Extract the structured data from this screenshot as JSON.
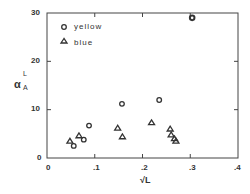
{
  "chart_data": {
    "type": "scatter",
    "title": "",
    "xlabel": "√L",
    "ylabel": "α_A^L",
    "xlim": [
      0,
      0.4
    ],
    "ylim": [
      0,
      30
    ],
    "xticks": [
      "0",
      ".1",
      ".2",
      ".3",
      ".4"
    ],
    "yticks": [
      "0",
      "10",
      "20",
      "30"
    ],
    "grid": false,
    "legend_position": "upper left inside",
    "series": [
      {
        "name": "yellow",
        "marker": "circle",
        "x": [
          0.056,
          0.077,
          0.088,
          0.157,
          0.235,
          0.304
        ],
        "y": [
          2.5,
          3.8,
          6.7,
          11.2,
          12.0,
          29.0
        ]
      },
      {
        "name": "blue",
        "marker": "triangle",
        "x": [
          0.048,
          0.067,
          0.148,
          0.158,
          0.219,
          0.258,
          0.26,
          0.267,
          0.27
        ],
        "y": [
          3.5,
          4.6,
          6.2,
          4.4,
          7.3,
          6.0,
          4.8,
          4.0,
          3.5
        ]
      }
    ]
  },
  "labels": {
    "legend_yellow": "yellow",
    "legend_blue": "blue",
    "y0": "0",
    "y10": "10",
    "y20": "20",
    "y30": "30",
    "x0": "0",
    "x1": ".1",
    "x2": ".2",
    "x3": ".3",
    "x4": ".4",
    "ylabel_main": "α",
    "ylabel_sup": "L",
    "ylabel_sub": "A",
    "xlabel": "√L"
  }
}
